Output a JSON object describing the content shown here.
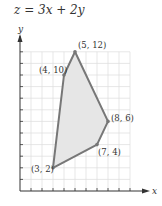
{
  "title": "z = 3x + 2y",
  "chart_data": {
    "type": "area",
    "title": "z = 3x + 2y",
    "xlabel": "x",
    "ylabel": "y",
    "xlim": [
      0,
      10
    ],
    "ylim": [
      0,
      12
    ],
    "grid": true,
    "polygon_vertices": [
      {
        "x": 3,
        "y": 2,
        "label": "(3, 2)"
      },
      {
        "x": 4,
        "y": 10,
        "label": "(4, 10)"
      },
      {
        "x": 5,
        "y": 12,
        "label": "(5, 12)"
      },
      {
        "x": 8,
        "y": 6,
        "label": "(8, 6)"
      },
      {
        "x": 7,
        "y": 4,
        "label": "(7, 4)"
      }
    ],
    "colors": {
      "fill": "#e6e6e6",
      "stroke": "#777777",
      "grid": "#dddddd",
      "axis": "#333333"
    }
  }
}
